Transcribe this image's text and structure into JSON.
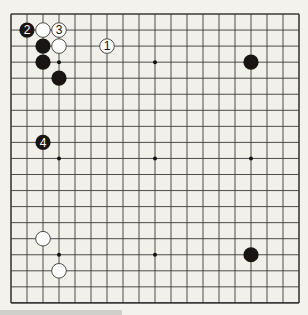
{
  "diagram": {
    "type": "go-board",
    "size": 19,
    "colors": {
      "background": "#f3f2ed",
      "board": "#f1f0ea",
      "line": "#3a3a3a",
      "black_stone": "#1a1414",
      "white_stone": "#ffffff",
      "white_outline": "#3a3a3a"
    },
    "star_points": [
      [
        3,
        3
      ],
      [
        9,
        3
      ],
      [
        15,
        3
      ],
      [
        3,
        9
      ],
      [
        9,
        9
      ],
      [
        15,
        9
      ],
      [
        3,
        15
      ],
      [
        9,
        15
      ],
      [
        15,
        15
      ]
    ],
    "stones": [
      {
        "color": "black",
        "col": 1,
        "row": 1,
        "label": "2"
      },
      {
        "color": "white",
        "col": 2,
        "row": 1,
        "label": ""
      },
      {
        "color": "white",
        "col": 3,
        "row": 1,
        "label": "3"
      },
      {
        "color": "black",
        "col": 2,
        "row": 2,
        "label": ""
      },
      {
        "color": "white",
        "col": 3,
        "row": 2,
        "label": ""
      },
      {
        "color": "white",
        "col": 6,
        "row": 2,
        "label": "1"
      },
      {
        "color": "black",
        "col": 2,
        "row": 3,
        "label": ""
      },
      {
        "color": "black",
        "col": 3,
        "row": 4,
        "label": ""
      },
      {
        "color": "black",
        "col": 15,
        "row": 3,
        "label": ""
      },
      {
        "color": "black",
        "col": 2,
        "row": 8,
        "label": "4"
      },
      {
        "color": "white",
        "col": 2,
        "row": 14,
        "label": ""
      },
      {
        "color": "white",
        "col": 3,
        "row": 16,
        "label": ""
      },
      {
        "color": "black",
        "col": 15,
        "row": 15,
        "label": ""
      }
    ]
  }
}
